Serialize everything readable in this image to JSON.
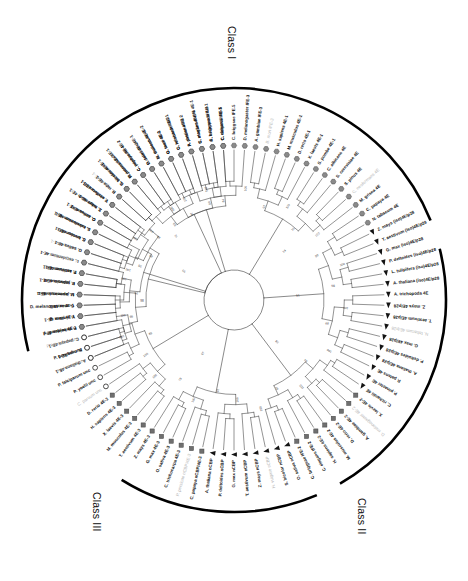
{
  "figure": {
    "type": "circular-phylogenetic-tree",
    "background": "#ffffff",
    "line_color": "#3b3b3b",
    "arc_color": "#000000",
    "center_x": 234,
    "center_y": 300,
    "tip_radius": 150,
    "arc_radius": 212
  },
  "class_arcs": [
    {
      "id": "class-1",
      "label": "Class I",
      "start_deg": -104,
      "end_deg": 68,
      "label_x": 238,
      "label_y": 26
    },
    {
      "id": "class-2",
      "label": "Class II",
      "start_deg": 76,
      "end_deg": 150,
      "label_x": 368,
      "label_y": 498
    },
    {
      "id": "class-3",
      "label": "Class III",
      "start_deg": 157,
      "end_deg": 212,
      "label_x": 103,
      "label_y": 492
    }
  ],
  "marker_legend": [
    {
      "shape": "hexagon",
      "name": "hexagon-marker",
      "fill": "#8a8a8a"
    },
    {
      "shape": "triangle",
      "name": "triangle-marker",
      "fill": "#1a1a1a"
    },
    {
      "shape": "circle",
      "name": "circle-marker",
      "fill": "#ffffff"
    },
    {
      "shape": "square",
      "name": "square-marker",
      "fill": "#6f6f6f"
    }
  ],
  "tips": [
    {
      "label": "A. thaliana 4E-1",
      "angle": -112,
      "marker": "hexagon",
      "dim": false
    },
    {
      "label": "B. rapa 4E-1",
      "angle": -108,
      "marker": "hexagon",
      "dim": false
    },
    {
      "label": "C. papaya 4E-1",
      "angle": -104,
      "marker": "hexagon",
      "dim": false
    },
    {
      "label": "P. deltoides 4E-1",
      "angle": -100,
      "marker": "hexagon",
      "dim": false
    },
    {
      "label": "V. vinifera 4E-1",
      "angle": -96,
      "marker": "hexagon",
      "dim": false
    },
    {
      "label": "G. max 4E-1",
      "angle": -92,
      "marker": "hexagon",
      "dim": false
    },
    {
      "label": "M. truncatula 4E-1",
      "angle": -88,
      "marker": "hexagon",
      "dim": false
    },
    {
      "label": "L. japonicus 4E-1",
      "angle": -84,
      "marker": "hexagon",
      "dim": false
    },
    {
      "label": "P. sativum 4E-1",
      "angle": -80,
      "marker": "hexagon",
      "dim": false
    },
    {
      "label": "L. esculentum 4E-1",
      "angle": -76,
      "marker": "hexagon",
      "dim": false
    },
    {
      "label": "N. tabacum 4E-1",
      "angle": -72,
      "marker": "hexagon",
      "dim": true
    },
    {
      "label": "C. annuum 4E-1",
      "angle": -68,
      "marker": "hexagon",
      "dim": false
    },
    {
      "label": "S. tuberosum 4E-1",
      "angle": -64,
      "marker": "hexagon",
      "dim": false
    },
    {
      "label": "O. sativa 4E-1",
      "angle": -60,
      "marker": "hexagon",
      "dim": false
    },
    {
      "label": "Z. mays 4E-1",
      "angle": -56,
      "marker": "hexagon",
      "dim": false
    },
    {
      "label": "T. aestivum 4E-1",
      "angle": -52,
      "marker": "hexagon",
      "dim": false
    },
    {
      "label": "H. vulgare 4E-1",
      "angle": -48,
      "marker": "hexagon",
      "dim": true
    },
    {
      "label": "S. bicolor 4E-1",
      "angle": -44,
      "marker": "hexagon",
      "dim": false
    },
    {
      "label": "P. patens 4E-2",
      "angle": -40,
      "marker": "hexagon",
      "dim": false
    },
    {
      "label": "C. reinhardtii 4E-2",
      "angle": -36,
      "marker": "hexagon",
      "dim": false
    },
    {
      "label": "O. tauri 4E-2",
      "angle": -32,
      "marker": "hexagon",
      "dim": false
    },
    {
      "label": "M. truncatula 4E-2",
      "angle": -28,
      "marker": "hexagon",
      "dim": false
    },
    {
      "label": "G. max 4E-2",
      "angle": -24,
      "marker": "hexagon",
      "dim": false
    },
    {
      "label": "G. hirsutum 4E-2",
      "angle": -20,
      "marker": "hexagon",
      "dim": false
    },
    {
      "label": "A. thaliana 4E-2",
      "angle": -16,
      "marker": "hexagon",
      "dim": false
    },
    {
      "label": "C. elegans IFE-4",
      "angle": -12,
      "marker": "hexagon",
      "dim": false
    },
    {
      "label": "C. briggsae IFE-4",
      "angle": -8,
      "marker": "hexagon",
      "dim": false
    },
    {
      "label": "C. elegans IFE-5",
      "angle": -4,
      "marker": "hexagon",
      "dim": false
    },
    {
      "label": "C. briggsae IFE-5",
      "angle": 0,
      "marker": "hexagon",
      "dim": false
    },
    {
      "label": "D. melanogaster IFE-3",
      "angle": 4,
      "marker": "hexagon",
      "dim": false
    },
    {
      "label": "A. gambiae IFE-3",
      "angle": 8,
      "marker": "hexagon",
      "dim": false
    },
    {
      "label": "B. mori IFE-3",
      "angle": 12,
      "marker": "hexagon",
      "dim": true
    },
    {
      "label": "H. sapiens 4E-1",
      "angle": 16,
      "marker": "hexagon",
      "dim": false
    },
    {
      "label": "M. musculus 4E-1",
      "angle": 20,
      "marker": "hexagon",
      "dim": false
    },
    {
      "label": "D. rerio 4E-1",
      "angle": 24,
      "marker": "hexagon",
      "dim": false
    },
    {
      "label": "X. laevis 4E-1",
      "angle": 28,
      "marker": "hexagon",
      "dim": false
    },
    {
      "label": "S. pombe 4E-1",
      "angle": 32,
      "marker": "hexagon",
      "dim": false
    },
    {
      "label": "C. albicans 4E",
      "angle": 36,
      "marker": "hexagon",
      "dim": false
    },
    {
      "label": "S. cerevisiae 4E",
      "angle": 40,
      "marker": "hexagon",
      "dim": false
    },
    {
      "label": "S. pinus 4E",
      "angle": 44,
      "marker": "hexagon",
      "dim": false
    },
    {
      "label": "C. neoformans 4E",
      "angle": 48,
      "marker": "hexagon",
      "dim": true
    },
    {
      "label": "M. grisea 4E",
      "angle": 52,
      "marker": "hexagon",
      "dim": false
    },
    {
      "label": "C. papaya 4E",
      "angle": 56,
      "marker": "hexagon",
      "dim": false
    },
    {
      "label": "N. tabacum 4E",
      "angle": 60,
      "marker": "hexagon",
      "dim": false
    },
    {
      "label": "Z. mays (iso)4E/p28",
      "angle": 64,
      "marker": "triangle",
      "dim": false
    },
    {
      "label": "T. aestivum (iso)4E/p28",
      "angle": 68,
      "marker": "triangle",
      "dim": false
    },
    {
      "label": "G. max (iso)4E/p28",
      "angle": 72,
      "marker": "triangle",
      "dim": false
    },
    {
      "label": "P. deltoides (iso)4E/p28",
      "angle": 76,
      "marker": "triangle",
      "dim": false
    },
    {
      "label": "L. tulipifera (iso)4E/p28",
      "angle": 80,
      "marker": "triangle",
      "dim": false
    },
    {
      "label": "A. thaliana (iso)4E/p28",
      "angle": 84,
      "marker": "triangle",
      "dim": false
    },
    {
      "label": "A. trichopoda 4E",
      "angle": 88,
      "marker": "triangle",
      "dim": false
    },
    {
      "label": "Z. mays 4E/p28",
      "angle": 92,
      "marker": "triangle",
      "dim": false
    },
    {
      "label": "T. aestivum 4E/p28",
      "angle": 96,
      "marker": "triangle",
      "dim": false
    },
    {
      "label": "N. tabacum 4E/p28",
      "angle": 100,
      "marker": "triangle",
      "dim": true
    },
    {
      "label": "G. max 4E/p28",
      "angle": 104,
      "marker": "triangle",
      "dim": false
    },
    {
      "label": "P. deltoides 4E/p28",
      "angle": 108,
      "marker": "triangle",
      "dim": false
    },
    {
      "label": "A. thaliana 4E/p28",
      "angle": 112,
      "marker": "triangle",
      "dim": false
    },
    {
      "label": "P. patens 4E",
      "angle": 116,
      "marker": "triangle",
      "dim": false
    },
    {
      "label": "P. pinaster 4E",
      "angle": 120,
      "marker": "triangle",
      "dim": false
    },
    {
      "label": "C. richardii 4E",
      "angle": 124,
      "marker": "triangle",
      "dim": false
    },
    {
      "label": "X. laevis 4E-2",
      "angle": 128,
      "marker": "square",
      "dim": false
    },
    {
      "label": "D. melanogaster 4E-2",
      "angle": 132,
      "marker": "square",
      "dim": true
    },
    {
      "label": "A. gambiae 4E-2",
      "angle": 136,
      "marker": "square",
      "dim": false
    },
    {
      "label": "D. rerio 4E-2",
      "angle": 140,
      "marker": "square",
      "dim": false
    },
    {
      "label": "M. musculus 4E-2",
      "angle": 144,
      "marker": "square",
      "dim": false
    },
    {
      "label": "H. sapiens 4E-2",
      "angle": 148,
      "marker": "square",
      "dim": false
    },
    {
      "label": "C. elegans IFE-2",
      "angle": 152,
      "marker": "square",
      "dim": false
    },
    {
      "label": "C. briggsae IFE-2",
      "angle": 156,
      "marker": "square",
      "dim": false
    },
    {
      "label": "O. sativa nCBP",
      "angle": 160,
      "marker": "triangle",
      "dim": false
    },
    {
      "label": "S. bicolor nCBP",
      "angle": 164,
      "marker": "triangle",
      "dim": false
    },
    {
      "label": "H. vulgare nCBP",
      "angle": 168,
      "marker": "triangle",
      "dim": true
    },
    {
      "label": "Z. mays nCBP",
      "angle": 172,
      "marker": "triangle",
      "dim": false
    },
    {
      "label": "T. aestivum nCBP",
      "angle": 176,
      "marker": "triangle",
      "dim": false
    },
    {
      "label": "G. max nCBP",
      "angle": 180,
      "marker": "triangle",
      "dim": false
    },
    {
      "label": "P. deltoides nCBP",
      "angle": 184,
      "marker": "triangle",
      "dim": false
    },
    {
      "label": "A. thaliana nCBP",
      "angle": 188,
      "marker": "triangle",
      "dim": false
    },
    {
      "label": "C. papaya nCBP/4E-3",
      "angle": 192,
      "marker": "square",
      "dim": false
    },
    {
      "label": "P. persicae nCBP/4E-3",
      "angle": 196,
      "marker": "square",
      "dim": true
    },
    {
      "label": "C. trichocarpa 4E-3",
      "angle": 200,
      "marker": "square",
      "dim": false
    },
    {
      "label": "O. sativa 4E-3",
      "angle": 204,
      "marker": "square",
      "dim": false
    },
    {
      "label": "G. max 4E-3",
      "angle": 208,
      "marker": "square",
      "dim": false
    },
    {
      "label": "Z. mays 4E-3",
      "angle": 212,
      "marker": "square",
      "dim": false
    },
    {
      "label": "T. aestivum 4E-3",
      "angle": 216,
      "marker": "square",
      "dim": false
    },
    {
      "label": "M. musculus 4E-3",
      "angle": 220,
      "marker": "square",
      "dim": false
    },
    {
      "label": "X. laevis 4E-3",
      "angle": 224,
      "marker": "square",
      "dim": false
    },
    {
      "label": "H. sapiens 4E-3",
      "angle": 228,
      "marker": "square",
      "dim": false
    },
    {
      "label": "D. rerio 4E-3",
      "angle": 232,
      "marker": "square",
      "dim": false
    },
    {
      "label": "C. parvum unc",
      "angle": 236,
      "marker": "circle",
      "dim": true
    },
    {
      "label": "P. yoelii unc",
      "angle": 240,
      "marker": "circle",
      "dim": false
    },
    {
      "label": "P. falciparum unc",
      "angle": 244,
      "marker": "circle",
      "dim": false
    },
    {
      "label": "P. chabaudi unc",
      "angle": 248,
      "marker": "circle",
      "dim": true
    },
    {
      "label": "P. berghei unc",
      "angle": 252,
      "marker": "circle",
      "dim": false
    },
    {
      "label": "P. falciparum unc",
      "angle": 256,
      "marker": "circle",
      "dim": true
    },
    {
      "label": "A. gambiae 4E-1",
      "angle": 260,
      "marker": "hexagon",
      "dim": false
    },
    {
      "label": "B. mori 4E-1",
      "angle": 264,
      "marker": "hexagon",
      "dim": false
    },
    {
      "label": "D. melanogaster 4E-1",
      "angle": 268,
      "marker": "hexagon",
      "dim": false
    },
    {
      "label": "L. japonicus 4E-1",
      "angle": 272,
      "marker": "hexagon",
      "dim": false
    },
    {
      "label": "P. sativum 4E-1",
      "angle": 276,
      "marker": "hexagon",
      "dim": false
    },
    {
      "label": "T. aestivum 4E-1",
      "angle": 280,
      "marker": "hexagon",
      "dim": false
    },
    {
      "label": "H. vulgare 4E-1",
      "angle": 284,
      "marker": "hexagon",
      "dim": true
    },
    {
      "label": "O. sativa 4E-1",
      "angle": 288,
      "marker": "hexagon",
      "dim": false
    },
    {
      "label": "S. bicolor 4E-1",
      "angle": 292,
      "marker": "hexagon",
      "dim": false
    },
    {
      "label": "L. esculentum 4E-1",
      "angle": 296,
      "marker": "hexagon",
      "dim": false
    },
    {
      "label": "C. annuum 4E-1",
      "angle": 300,
      "marker": "hexagon",
      "dim": false
    },
    {
      "label": "S. tuberosum 4E-1",
      "angle": 304,
      "marker": "hexagon",
      "dim": false
    },
    {
      "label": "V. vinifera 4E-1",
      "angle": 308,
      "marker": "hexagon",
      "dim": false
    },
    {
      "label": "B. rapa 4E-1",
      "angle": 312,
      "marker": "hexagon",
      "dim": false
    },
    {
      "label": "G. hirsutum 4E-1",
      "angle": 316,
      "marker": "hexagon",
      "dim": false
    },
    {
      "label": "M. truncatula 4E-1",
      "angle": 320,
      "marker": "hexagon",
      "dim": false
    },
    {
      "label": "C. papaya 4E-1",
      "angle": 324,
      "marker": "hexagon",
      "dim": false
    },
    {
      "label": "P. deltoides 4E-1",
      "angle": 328,
      "marker": "hexagon",
      "dim": false
    },
    {
      "label": "A. thaliana 4E-1",
      "angle": 332,
      "marker": "hexagon",
      "dim": false
    },
    {
      "label": "O. tauri 4E-1",
      "angle": 336,
      "marker": "hexagon",
      "dim": false
    },
    {
      "label": "C. reinhardtii 4E-1",
      "angle": 340,
      "marker": "hexagon",
      "dim": false
    },
    {
      "label": "P. patens 4E-1",
      "angle": 344,
      "marker": "hexagon",
      "dim": false
    },
    {
      "label": "S. moellendorffii 4E-1",
      "angle": 348,
      "marker": "hexagon",
      "dim": false
    },
    {
      "label": "A. trichopoda 4E-1",
      "angle": 352,
      "marker": "hexagon",
      "dim": false
    },
    {
      "label": "C. richardii 4E-1",
      "angle": 356,
      "marker": "hexagon",
      "dim": false
    }
  ],
  "bootstrap_values": [
    {
      "value": "100",
      "angle": -108,
      "radius": 118
    },
    {
      "value": "99",
      "angle": -99,
      "radius": 104
    },
    {
      "value": "86",
      "angle": -90,
      "radius": 92
    },
    {
      "value": "100",
      "angle": -79,
      "radius": 112
    },
    {
      "value": "95",
      "angle": -70,
      "radius": 100
    },
    {
      "value": "100",
      "angle": -58,
      "radius": 116
    },
    {
      "value": "88",
      "angle": -50,
      "radius": 98
    },
    {
      "value": "72",
      "angle": -42,
      "radius": 86
    },
    {
      "value": "100",
      "angle": -34,
      "radius": 110
    },
    {
      "value": "97",
      "angle": -26,
      "radius": 96
    },
    {
      "value": "100",
      "angle": -14,
      "radius": 114
    },
    {
      "value": "84",
      "angle": -6,
      "radius": 100
    },
    {
      "value": "100",
      "angle": 6,
      "radius": 112
    },
    {
      "value": "91",
      "angle": 18,
      "radius": 98
    },
    {
      "value": "100",
      "angle": 30,
      "radius": 108
    },
    {
      "value": "76",
      "angle": 40,
      "radius": 92
    },
    {
      "value": "100",
      "angle": 52,
      "radius": 106
    },
    {
      "value": "99",
      "angle": 62,
      "radius": 94
    },
    {
      "value": "100",
      "angle": 72,
      "radius": 114
    },
    {
      "value": "98",
      "angle": 82,
      "radius": 100
    },
    {
      "value": "100",
      "angle": 94,
      "radius": 112
    },
    {
      "value": "89",
      "angle": 104,
      "radius": 96
    },
    {
      "value": "100",
      "angle": 118,
      "radius": 108
    },
    {
      "value": "94",
      "angle": 130,
      "radius": 94
    },
    {
      "value": "100",
      "angle": 142,
      "radius": 110
    },
    {
      "value": "87",
      "angle": 154,
      "radius": 98
    },
    {
      "value": "100",
      "angle": 166,
      "radius": 112
    },
    {
      "value": "100",
      "angle": 178,
      "radius": 100
    },
    {
      "value": "92",
      "angle": 190,
      "radius": 92
    },
    {
      "value": "100",
      "angle": 202,
      "radius": 108
    },
    {
      "value": "79",
      "angle": 214,
      "radius": 96
    },
    {
      "value": "100",
      "angle": 226,
      "radius": 110
    },
    {
      "value": "100",
      "angle": 238,
      "radius": 104
    },
    {
      "value": "83",
      "angle": 248,
      "radius": 90
    },
    {
      "value": "100",
      "angle": 262,
      "radius": 112
    },
    {
      "value": "96",
      "angle": 274,
      "radius": 98
    },
    {
      "value": "100",
      "angle": 286,
      "radius": 110
    },
    {
      "value": "85",
      "angle": 298,
      "radius": 94
    },
    {
      "value": "100",
      "angle": 310,
      "radius": 108
    },
    {
      "value": "93",
      "angle": 322,
      "radius": 96
    },
    {
      "value": "100",
      "angle": 334,
      "radius": 112
    },
    {
      "value": "90",
      "angle": 346,
      "radius": 100
    },
    {
      "value": "74",
      "angle": 46,
      "radius": 70
    },
    {
      "value": "61",
      "angle": 86,
      "radius": 64
    },
    {
      "value": "58",
      "angle": 134,
      "radius": 60
    },
    {
      "value": "67",
      "angle": 210,
      "radius": 62
    },
    {
      "value": "55",
      "angle": 300,
      "radius": 58
    }
  ]
}
